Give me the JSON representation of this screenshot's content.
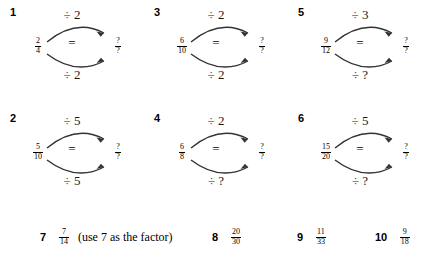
{
  "worksheet": {
    "title": "Simplifying Fractions Worksheet",
    "diagram_problems": [
      {
        "number": "1",
        "left_fraction": {
          "numerator": "2",
          "denominator": "4"
        },
        "relation": "=",
        "right_fraction": {
          "numerator": "?",
          "denominator": "?"
        },
        "top_operation": "÷ 2",
        "bottom_operation": "÷ 2",
        "col": 0,
        "row": 0
      },
      {
        "number": "3",
        "left_fraction": {
          "numerator": "6",
          "denominator": "10"
        },
        "relation": "=",
        "right_fraction": {
          "numerator": "?",
          "denominator": "?"
        },
        "top_operation": "÷ 2",
        "bottom_operation": "÷ 2",
        "col": 1,
        "row": 0
      },
      {
        "number": "5",
        "left_fraction": {
          "numerator": "9",
          "denominator": "12"
        },
        "relation": "=",
        "right_fraction": {
          "numerator": "?",
          "denominator": "?"
        },
        "top_operation": "÷ 3",
        "bottom_operation": "÷ ?",
        "col": 2,
        "row": 0
      },
      {
        "number": "2",
        "left_fraction": {
          "numerator": "5",
          "denominator": "10"
        },
        "relation": "=",
        "right_fraction": {
          "numerator": "?",
          "denominator": "?"
        },
        "top_operation": "÷ 5",
        "bottom_operation": "÷ 5",
        "col": 0,
        "row": 1
      },
      {
        "number": "4",
        "left_fraction": {
          "numerator": "6",
          "denominator": "8"
        },
        "relation": "=",
        "right_fraction": {
          "numerator": "?",
          "denominator": "?"
        },
        "top_operation": "÷ 2",
        "bottom_operation": "÷ ?",
        "col": 1,
        "row": 1
      },
      {
        "number": "6",
        "left_fraction": {
          "numerator": "15",
          "denominator": "20"
        },
        "relation": "=",
        "right_fraction": {
          "numerator": "?",
          "denominator": "?"
        },
        "top_operation": "÷ 5",
        "bottom_operation": "÷ ?",
        "col": 2,
        "row": 1
      }
    ],
    "list_problems": [
      {
        "number": "7",
        "fraction": {
          "numerator": "7",
          "denominator": "14"
        },
        "note": "(use 7 as the factor)",
        "left": 40
      },
      {
        "number": "8",
        "fraction": {
          "numerator": "20",
          "denominator": "30"
        },
        "note": "",
        "left": 212
      },
      {
        "number": "9",
        "fraction": {
          "numerator": "11",
          "denominator": "33"
        },
        "note": "",
        "left": 297
      },
      {
        "number": "10",
        "fraction": {
          "numerator": "9",
          "denominator": "18"
        },
        "note": "",
        "left": 375
      }
    ]
  }
}
